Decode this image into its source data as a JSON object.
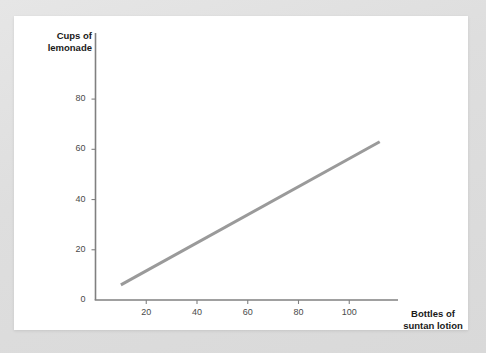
{
  "page": {
    "background_color": "#e0e0e0",
    "card_color": "#ffffff"
  },
  "chart_data": {
    "type": "line",
    "title": "",
    "subtitle": "",
    "xlabel": "Bottles of\nsuntan lotion",
    "ylabel": "Cups of\nlemonade",
    "xlim": [
      0,
      120
    ],
    "ylim": [
      0,
      88
    ],
    "xticks": [
      20,
      40,
      60,
      80,
      100
    ],
    "xtick_labels": [
      "20",
      "40",
      "60",
      "80",
      "100"
    ],
    "yticks": [
      0,
      20,
      40,
      60,
      80
    ],
    "ytick_labels": [
      "0",
      "20",
      "40",
      "60",
      "80"
    ],
    "grid": false,
    "legend": null,
    "series": [
      {
        "name": "lemonade vs suntan lotion",
        "color": "#9a9a9a",
        "linewidth": 3,
        "x": [
          10,
          112
        ],
        "y": [
          6,
          63
        ]
      }
    ],
    "annotations": [],
    "axis_color": "#808080",
    "tick_color": "#808080"
  }
}
